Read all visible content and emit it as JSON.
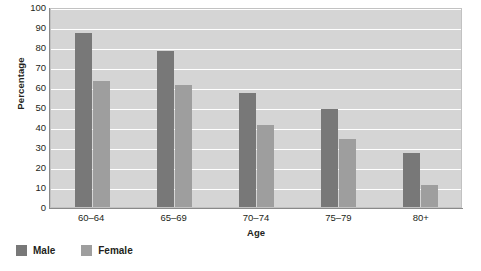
{
  "chart_data": {
    "type": "bar",
    "title": "",
    "xlabel": "Age",
    "ylabel": "Percentage",
    "categories": [
      "60–64",
      "65–69",
      "70–74",
      "75–79",
      "80+"
    ],
    "series": [
      {
        "name": "Male",
        "values": [
          87,
          78,
          57,
          49,
          27
        ],
        "color": "#787878"
      },
      {
        "name": "Female",
        "values": [
          63,
          61,
          41,
          34,
          11
        ],
        "color": "#9e9e9e"
      }
    ],
    "ylim": [
      0,
      100
    ],
    "ytick_step": 10,
    "yticks": [
      0,
      10,
      20,
      30,
      40,
      50,
      60,
      70,
      80,
      90,
      100
    ],
    "ytick_labels": [
      "0",
      "10",
      "20",
      "30",
      "40",
      "50",
      "60",
      "70",
      "80",
      "90",
      "100"
    ],
    "grid": true,
    "grid_color": "#ffffff",
    "plot_background": "#d5d5d5",
    "legend_position": "bottom-left",
    "legend_entries": [
      "Male",
      "Female"
    ]
  },
  "axes": {
    "y_title": "Percentage",
    "x_title": "Age"
  },
  "legend": {
    "items": [
      {
        "label": "Male"
      },
      {
        "label": "Female"
      }
    ]
  }
}
